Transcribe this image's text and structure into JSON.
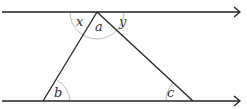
{
  "diagram": {
    "title": "",
    "type": "parallel lines with transversal triangle",
    "colors": {
      "line": "#222222",
      "arc": "#bbbbbb",
      "label": "#333333"
    },
    "parallel_lines": [
      {
        "name": "top-line",
        "y": 12,
        "x1": 2,
        "x2": 240,
        "arrow": true
      },
      {
        "name": "bottom-line",
        "y": 101,
        "x1": 2,
        "x2": 240,
        "arrow": true
      }
    ],
    "triangle": {
      "apex": {
        "x": 97,
        "y": 12
      },
      "bottom_left": {
        "x": 43,
        "y": 101
      },
      "bottom_right": {
        "x": 193,
        "y": 101
      }
    },
    "angle_labels": {
      "x": "x",
      "y": "y",
      "a": "a",
      "b": "b",
      "c": "c"
    }
  }
}
